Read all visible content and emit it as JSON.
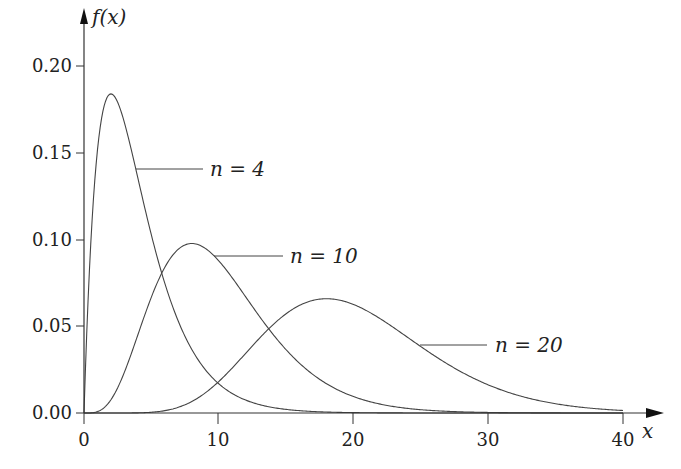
{
  "chart_data": {
    "type": "line",
    "title": "",
    "xlabel": "x",
    "ylabel": "f(x)",
    "xlim": [
      0,
      40
    ],
    "ylim": [
      0,
      0.2
    ],
    "xticks": [
      0,
      10,
      20,
      30,
      40
    ],
    "xtick_labels": [
      "0",
      "10",
      "20",
      "30",
      "40"
    ],
    "yticks": [
      0.0,
      0.05,
      0.1,
      0.15,
      0.2
    ],
    "ytick_labels": [
      "0.00",
      "0.05",
      "0.10",
      "0.15",
      "0.20"
    ],
    "grid": false,
    "legend": "inline leader-line labels",
    "series": [
      {
        "name": "n = 4",
        "n": 4,
        "label": "n = 4",
        "peak": {
          "x": 2,
          "y": 0.184
        },
        "x": [
          0,
          1,
          2,
          3,
          4,
          6,
          8,
          10,
          12,
          15,
          20,
          25,
          30,
          40
        ],
        "y": [
          0,
          0.152,
          0.184,
          0.167,
          0.135,
          0.075,
          0.037,
          0.017,
          0.007,
          0.002,
          0.0,
          0.0,
          0.0,
          0.0
        ]
      },
      {
        "name": "n = 10",
        "n": 10,
        "label": "n = 10",
        "peak": {
          "x": 8,
          "y": 0.098
        },
        "x": [
          0,
          2,
          4,
          6,
          8,
          10,
          12,
          14,
          16,
          20,
          25,
          30,
          40
        ],
        "y": [
          0,
          0.008,
          0.045,
          0.084,
          0.098,
          0.088,
          0.067,
          0.046,
          0.03,
          0.009,
          0.002,
          0.0,
          0.0
        ]
      },
      {
        "name": "n = 20",
        "n": 20,
        "label": "n = 20",
        "peak": {
          "x": 18,
          "y": 0.066
        },
        "x": [
          0,
          5,
          8,
          10,
          12,
          14,
          16,
          18,
          20,
          22,
          25,
          30,
          35,
          40
        ],
        "y": [
          0,
          0.0005,
          0.006,
          0.013,
          0.028,
          0.044,
          0.058,
          0.066,
          0.063,
          0.056,
          0.042,
          0.019,
          0.007,
          0.002
        ]
      }
    ]
  },
  "labels": {
    "y_axis": "f(x)",
    "x_axis": "x",
    "n4": "n = 4",
    "n10": "n = 10",
    "n20": "n = 20"
  },
  "ticks": {
    "x": [
      "0",
      "10",
      "20",
      "30",
      "40"
    ],
    "y": [
      "0.00",
      "0.05",
      "0.10",
      "0.15",
      "0.20"
    ]
  }
}
